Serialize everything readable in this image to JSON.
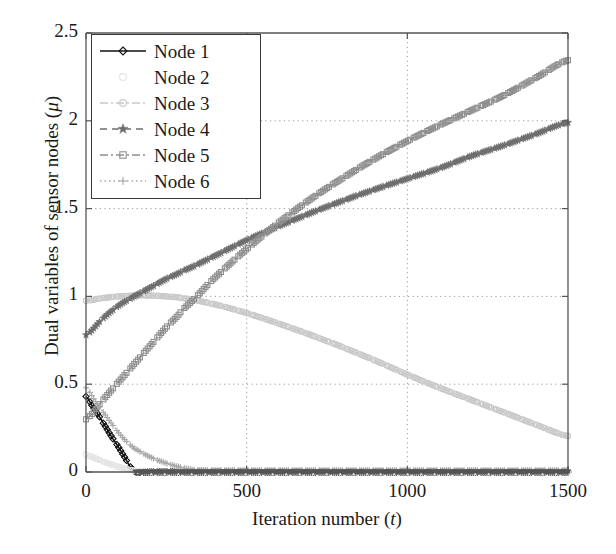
{
  "figure": {
    "background": "#ffffff",
    "axes_color": "#555555",
    "grid_color": "#9a9a9a"
  },
  "axis": {
    "xlabel_prefix": "Iteration number (",
    "xlabel_var": "t",
    "xlabel_suffix": ")",
    "ylabel_prefix": "Dual variables of sensor nodes (",
    "ylabel_var": "μ",
    "ylabel_suffix": ")",
    "xticks": [
      "0",
      "500",
      "1000",
      "1500"
    ],
    "yticks": [
      "0",
      "0.5",
      "1",
      "1.5",
      "2",
      "2.5"
    ]
  },
  "legend": {
    "items": [
      {
        "label": "Node 1",
        "color": "#111111",
        "marker": "diamond",
        "dash": "solid"
      },
      {
        "label": "Node 2",
        "color": "#e4e4e4",
        "marker": "circle",
        "dash": "solid"
      },
      {
        "label": "Node 3",
        "color": "#c9c9c9",
        "marker": "circle",
        "dash": "dashdot"
      },
      {
        "label": "Node 4",
        "color": "#6e6e6e",
        "marker": "star",
        "dash": "dashed"
      },
      {
        "label": "Node 5",
        "color": "#8f8f8f",
        "marker": "square",
        "dash": "dashdot"
      },
      {
        "label": "Node 6",
        "color": "#a8a8a8",
        "marker": "plus",
        "dash": "dotted"
      }
    ]
  },
  "chart_data": {
    "type": "line",
    "title": "",
    "xlabel": "Iteration number (t)",
    "ylabel": "Dual variables of sensor nodes (μ)",
    "xlim": [
      0,
      1500
    ],
    "ylim": [
      0,
      2.5
    ],
    "grid": true,
    "legend_position": "upper-left",
    "xticks": [
      0,
      500,
      1000,
      1500
    ],
    "yticks": [
      0,
      0.5,
      1,
      1.5,
      2,
      2.5
    ],
    "series": [
      {
        "name": "Node 1",
        "color": "#111111",
        "marker": "diamond",
        "x": [
          0,
          20,
          40,
          60,
          80,
          100,
          120,
          140,
          155,
          200,
          400,
          700,
          1000,
          1300,
          1500
        ],
        "y": [
          0.43,
          0.375,
          0.32,
          0.26,
          0.2,
          0.145,
          0.085,
          0.025,
          0.0,
          0.0,
          0.0,
          0.0,
          0.0,
          0.0,
          0.0
        ]
      },
      {
        "name": "Node 2",
        "color": "#e4e4e4",
        "marker": "circle",
        "x": [
          0,
          20,
          40,
          60,
          80,
          100,
          130,
          160,
          200,
          400,
          700,
          1000,
          1300,
          1500
        ],
        "y": [
          0.1,
          0.085,
          0.07,
          0.055,
          0.042,
          0.03,
          0.015,
          0.005,
          0.0,
          0.0,
          0.0,
          0.0,
          0.0,
          0.0
        ]
      },
      {
        "name": "Node 3",
        "color": "#c9c9c9",
        "marker": "circle",
        "x": [
          0,
          50,
          100,
          150,
          200,
          250,
          300,
          400,
          500,
          600,
          700,
          800,
          900,
          1000,
          1100,
          1200,
          1300,
          1400,
          1500
        ],
        "y": [
          0.975,
          0.99,
          1.0,
          1.005,
          1.005,
          1.0,
          0.99,
          0.955,
          0.905,
          0.845,
          0.78,
          0.71,
          0.635,
          0.555,
          0.48,
          0.41,
          0.34,
          0.27,
          0.205
        ]
      },
      {
        "name": "Node 4",
        "color": "#6e6e6e",
        "marker": "star",
        "x": [
          0,
          50,
          100,
          150,
          200,
          250,
          300,
          400,
          500,
          600,
          700,
          800,
          900,
          1000,
          1100,
          1200,
          1300,
          1400,
          1500
        ],
        "y": [
          0.78,
          0.87,
          0.945,
          1.0,
          1.05,
          1.1,
          1.145,
          1.23,
          1.32,
          1.4,
          1.475,
          1.545,
          1.61,
          1.67,
          1.73,
          1.8,
          1.86,
          1.925,
          1.99
        ]
      },
      {
        "name": "Node 5",
        "color": "#8f8f8f",
        "marker": "square",
        "x": [
          0,
          50,
          100,
          150,
          200,
          250,
          300,
          400,
          500,
          600,
          700,
          800,
          900,
          1000,
          1100,
          1200,
          1300,
          1400,
          1500
        ],
        "y": [
          0.3,
          0.405,
          0.51,
          0.615,
          0.72,
          0.825,
          0.925,
          1.105,
          1.27,
          1.42,
          1.555,
          1.675,
          1.785,
          1.885,
          1.975,
          2.06,
          2.145,
          2.245,
          2.345
        ]
      },
      {
        "name": "Node 6",
        "color": "#a8a8a8",
        "marker": "plus",
        "x": [
          0,
          30,
          60,
          90,
          120,
          150,
          200,
          250,
          300,
          340,
          400,
          500,
          700,
          1000,
          1300,
          1500
        ],
        "y": [
          0.48,
          0.4,
          0.325,
          0.25,
          0.185,
          0.135,
          0.085,
          0.05,
          0.025,
          0.012,
          0.01,
          0.01,
          0.01,
          0.01,
          0.01,
          0.01
        ]
      },
      {
        "name": "Node 1 floor",
        "color": "#555555",
        "marker": "triangle",
        "x": [
          155,
          300,
          500,
          700,
          900,
          1100,
          1300,
          1500
        ],
        "y": [
          0.0,
          0.0,
          0.0,
          0.0,
          0.0,
          0.0,
          0.0,
          0.0
        ]
      }
    ]
  }
}
